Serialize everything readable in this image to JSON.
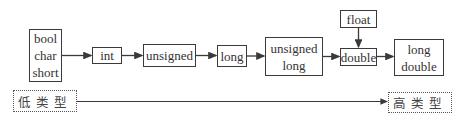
{
  "diagram": {
    "title": "",
    "nodes": [
      {
        "id": "small_ints",
        "lines": [
          "bool",
          "char",
          "short"
        ]
      },
      {
        "id": "int",
        "lines": [
          "int"
        ]
      },
      {
        "id": "unsigned",
        "lines": [
          "unsigned"
        ]
      },
      {
        "id": "long",
        "lines": [
          "long"
        ]
      },
      {
        "id": "unsigned_long",
        "lines": [
          "unsigned",
          "long"
        ]
      },
      {
        "id": "float",
        "lines": [
          "float"
        ]
      },
      {
        "id": "double",
        "lines": [
          "double"
        ]
      },
      {
        "id": "long_double",
        "lines": [
          "long",
          "double"
        ]
      }
    ],
    "edges": [
      {
        "from": "small_ints",
        "to": "int"
      },
      {
        "from": "int",
        "to": "unsigned"
      },
      {
        "from": "unsigned",
        "to": "long"
      },
      {
        "from": "long",
        "to": "unsigned_long"
      },
      {
        "from": "unsigned_long",
        "to": "double"
      },
      {
        "from": "float",
        "to": "double"
      },
      {
        "from": "double",
        "to": "long_double"
      }
    ],
    "scale": {
      "low_label": "低类型",
      "high_label": "高类型"
    },
    "colors": {
      "stroke": "#3a3a3a",
      "background": "#ffffff"
    }
  }
}
